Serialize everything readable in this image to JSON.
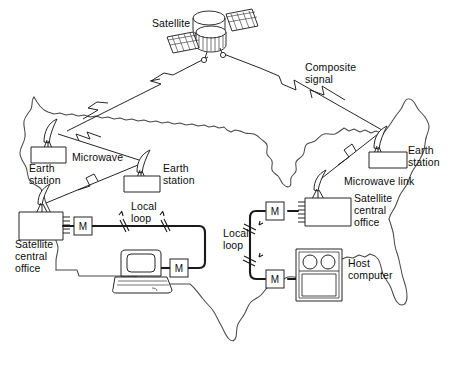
{
  "figure": {
    "kind": "network-diagram",
    "line_color": "#1a1a1a",
    "text_color": "#0c0c0c",
    "background_color": "#ffffff"
  },
  "labels": {
    "satellite": "Satellite",
    "composite_signal": "Composite\nsignal",
    "composite_signal_line1": "Composite",
    "composite_signal_line2": "signal",
    "earth_station_left": "Earth\nstation",
    "earth_station_left_line1": "Earth",
    "earth_station_left_line2": "station",
    "earth_station_mid": "Earth\nstation",
    "earth_station_mid_line1": "Earth",
    "earth_station_mid_line2": "station",
    "earth_station_right": "Earth\nstation",
    "earth_station_right_line1": "Earth",
    "earth_station_right_line2": "station",
    "microwave": "Microwave",
    "microwave_link": "Microwave link",
    "sco_left_line1": "Satellite",
    "sco_left_line2": "central",
    "sco_left_line3": "office",
    "sco_right_line1": "Satellite",
    "sco_right_line2": "central",
    "sco_right_line3": "office",
    "local_loop_left_line1": "Local",
    "local_loop_left_line2": "loop",
    "local_loop_right_line1": "Local",
    "local_loop_right_line2": "loop",
    "host_computer_line1": "Host",
    "host_computer_line2": "computer",
    "modem_symbol": "M"
  },
  "nodes": [
    {
      "id": "satellite",
      "name": "satellite",
      "label": "Satellite",
      "x": 215,
      "y": 30
    },
    {
      "id": "earth-station-left",
      "name": "earth-station",
      "label": "Earth station",
      "x": 52,
      "y": 140
    },
    {
      "id": "earth-station-mid",
      "name": "earth-station",
      "label": "Earth station",
      "x": 146,
      "y": 172
    },
    {
      "id": "earth-station-right",
      "name": "earth-station",
      "label": "Earth station",
      "x": 392,
      "y": 148
    },
    {
      "id": "sco-left",
      "name": "satellite-central-office",
      "label": "Satellite central office",
      "x": 44,
      "y": 220
    },
    {
      "id": "sco-right",
      "name": "satellite-central-office",
      "label": "Satellite central office",
      "x": 330,
      "y": 208
    },
    {
      "id": "modem-left-1",
      "name": "modem",
      "label": "M",
      "x": 82,
      "y": 226
    },
    {
      "id": "modem-left-2",
      "name": "modem",
      "label": "M",
      "x": 179,
      "y": 268
    },
    {
      "id": "modem-right-1",
      "name": "modem",
      "label": "M",
      "x": 276,
      "y": 211
    },
    {
      "id": "modem-right-2",
      "name": "modem",
      "label": "M",
      "x": 276,
      "y": 279
    },
    {
      "id": "terminal",
      "name": "terminal-workstation",
      "label": "terminal",
      "x": 138,
      "y": 278
    },
    {
      "id": "host-computer",
      "name": "host-computer",
      "label": "Host computer",
      "x": 307,
      "y": 273
    }
  ],
  "links": [
    {
      "id": "sat-to-left",
      "name": "satellite-uplink-left",
      "type": "composite-signal",
      "from": "satellite",
      "to": "earth-station-left"
    },
    {
      "id": "sat-to-right",
      "name": "satellite-uplink-right",
      "type": "composite-signal",
      "from": "satellite",
      "to": "earth-station-right"
    },
    {
      "id": "mw-left-mid",
      "name": "microwave-link",
      "type": "microwave",
      "from": "earth-station-left",
      "to": "earth-station-mid"
    },
    {
      "id": "mw-mid-sco",
      "name": "microwave-link",
      "type": "microwave",
      "from": "earth-station-mid",
      "to": "sco-left"
    },
    {
      "id": "mw-right",
      "name": "microwave-link",
      "type": "microwave",
      "from": "earth-station-right",
      "to": "sco-right"
    },
    {
      "id": "loop-left",
      "name": "local-loop",
      "type": "local-loop",
      "from": "sco-left",
      "to": "terminal"
    },
    {
      "id": "loop-right",
      "name": "local-loop",
      "type": "local-loop",
      "from": "sco-right",
      "to": "host-computer"
    }
  ]
}
